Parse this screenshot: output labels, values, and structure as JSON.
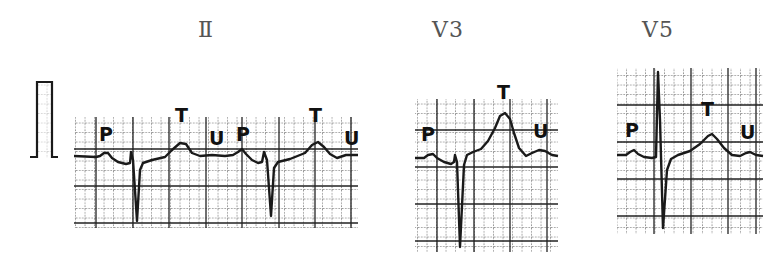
{
  "figure": {
    "leads": [
      {
        "id": "II",
        "label": "Ⅱ",
        "wave_labels": [
          "P",
          "T",
          "U",
          "P",
          "T",
          "U"
        ]
      },
      {
        "id": "V3",
        "label": "V3",
        "wave_labels": [
          "P",
          "T",
          "U"
        ]
      },
      {
        "id": "V5",
        "label": "V5",
        "wave_labels": [
          "P",
          "T",
          "U"
        ]
      }
    ],
    "calibration_pulse": {
      "present": true
    },
    "colors": {
      "trace": "#1a1a1a",
      "grid": "#2a2a2a",
      "label": "#555555"
    }
  }
}
